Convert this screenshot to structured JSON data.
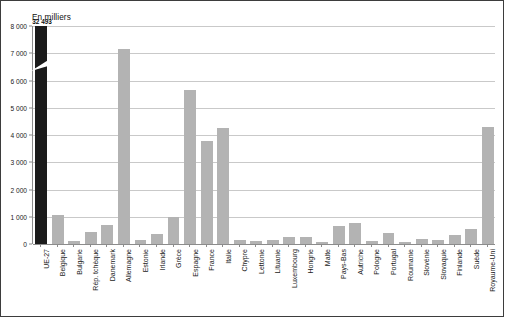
{
  "figure": {
    "title": "En milliers",
    "border_color": "#3d3d3d",
    "background": "#ffffff"
  },
  "colors": {
    "bar": "#b3b3b3",
    "bar_highlight": "#1b1b1b",
    "gridline": "#c9c9c9",
    "axis": "#8c8c8c",
    "text": "#1a1a1a"
  },
  "chart_data": {
    "type": "bar",
    "title": "En milliers",
    "xlabel": "",
    "ylabel": "",
    "ylim": [
      0,
      8000
    ],
    "grid": true,
    "legend": null,
    "ytick_labels": [
      "8 000",
      "7 000",
      "6 000",
      "5 000",
      "4 000",
      "3 000",
      "2 000",
      "1 000",
      "0"
    ],
    "yticks": [
      8000,
      7000,
      6000,
      5000,
      4000,
      3000,
      2000,
      1000,
      0
    ],
    "axis_break": {
      "bar": "UE-27",
      "note": "bar truncated with diagonal break mark",
      "true_value": 32493,
      "value_label": "32 493"
    },
    "categories": [
      "UE-27",
      "Belgique",
      "Bulgarie",
      "Rép. tchèque",
      "Danemark",
      "Allemagne",
      "Estonie",
      "Irlande",
      "Grèce",
      "Espagne",
      "France",
      "Italie",
      "Chypre",
      "Lettonie",
      "Lituanie",
      "Luxembourg",
      "Hongrie",
      "Malte",
      "Pays-Bas",
      "Autriche",
      "Pologne",
      "Portugal",
      "Roumanie",
      "Slovénie",
      "Slovaquie",
      "Finlande",
      "Suède",
      "Royaume-Uni"
    ],
    "values": [
      32493,
      1050,
      120,
      440,
      700,
      7150,
      130,
      350,
      980,
      5650,
      3780,
      4250,
      130,
      110,
      130,
      270,
      250,
      60,
      650,
      780,
      100,
      420,
      90,
      170,
      160,
      320,
      550,
      4300
    ],
    "value_labels": [
      "32 493",
      "",
      "",
      "",
      "",
      "",
      "",
      "",
      "",
      "",
      "",
      "",
      "",
      "",
      "",
      "",
      "",
      "",
      "",
      "",
      "",
      "",
      "",
      "",
      "",
      "",
      "",
      ""
    ],
    "highlight_index": 0
  }
}
